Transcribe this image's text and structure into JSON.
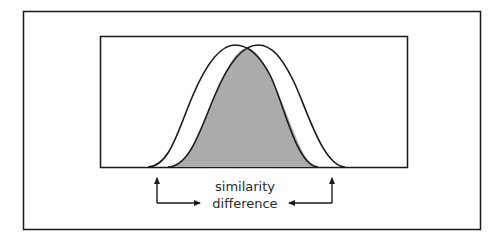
{
  "diagram": {
    "type": "overlapping-distributions",
    "labels": {
      "line1": "similarity",
      "line2": "difference"
    },
    "colors": {
      "stroke": "#1a1a1a",
      "overlap_fill": "#ababab",
      "background": "#ffffff"
    },
    "curves": [
      {
        "name": "left-distribution",
        "start_x": 148,
        "peak_x": 235,
        "end_x": 318
      },
      {
        "name": "right-distribution",
        "start_x": 168,
        "peak_x": 258,
        "end_x": 345
      }
    ],
    "arrows": [
      {
        "name": "left-arrow",
        "direction": "up-then-right"
      },
      {
        "name": "right-arrow",
        "direction": "up-then-left"
      }
    ]
  }
}
